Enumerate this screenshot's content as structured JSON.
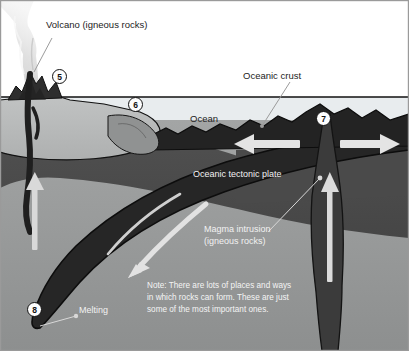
{
  "diagram": {
    "frame_border_color": "#9a9a9a",
    "colors": {
      "sky": "#ffffff",
      "ocean_water": "#e8ecee",
      "continental_crust": "#b9bbbb",
      "upper_mantle": "#4c4c4c",
      "lower_mantle": "#9a9c9c",
      "oceanic_plate": "#2b2b2b",
      "magma": "#3a3a3a",
      "plume_smoke": "#dcdcdc",
      "arrow_white": "#e6e6e6",
      "outline": "#111111"
    }
  },
  "labels": {
    "volcano": "Volcano (igneous rocks)",
    "oceanic_crust": "Oceanic crust",
    "ocean": "Ocean",
    "oceanic_tectonic_plate": "Oceanic tectonic plate",
    "magma_intrusion_line1": "Magma intrusion",
    "magma_intrusion_line2": "(igneous rocks)",
    "melting": "Melting"
  },
  "note": {
    "line1": "Note: There are lots of places and ways",
    "line2": "in which rocks can form. These are just",
    "line3": "some of the most important ones."
  },
  "markers": [
    {
      "id": "5",
      "label": "5",
      "meaning": "volcano-eruption-point"
    },
    {
      "id": "6",
      "label": "6",
      "meaning": "seafloor-sediment-deposition"
    },
    {
      "id": "7",
      "label": "7",
      "meaning": "mid-ocean-ridge-spreading-centre"
    },
    {
      "id": "8",
      "label": "8",
      "meaning": "subducting-slab-melting-zone"
    }
  ],
  "arrows": [
    {
      "name": "ridge-spreading-left",
      "direction": "left"
    },
    {
      "name": "ridge-spreading-right",
      "direction": "right"
    },
    {
      "name": "ridge-magma-rising",
      "direction": "up"
    },
    {
      "name": "subduction-descending",
      "direction": "down-left"
    },
    {
      "name": "volcano-magma-rising",
      "direction": "up"
    }
  ]
}
